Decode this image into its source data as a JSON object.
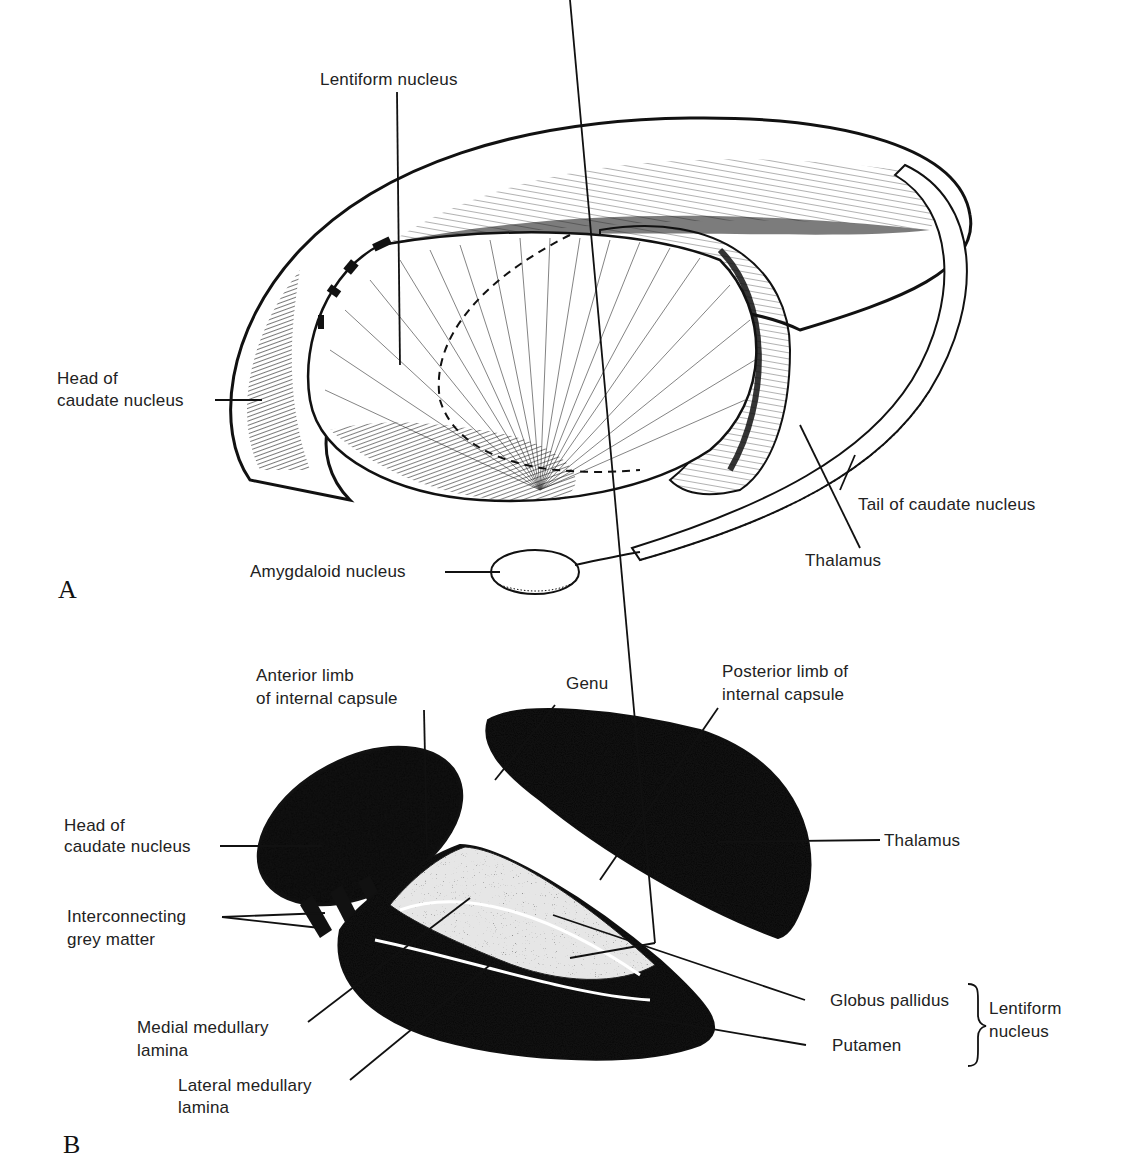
{
  "panels": [
    {
      "letter": "A",
      "labels": {
        "lentiform": "Lentiform nucleus",
        "head_caudate_1": "Head of",
        "head_caudate_2": "caudate nucleus",
        "tail_caudate": "Tail of caudate nucleus",
        "thalamus": "Thalamus",
        "amygdaloid": "Amygdaloid nucleus"
      }
    },
    {
      "letter": "B",
      "labels": {
        "anterior_limb_1": "Anterior limb",
        "anterior_limb_2": "of internal capsule",
        "genu": "Genu",
        "posterior_limb_1": "Posterior limb of",
        "posterior_limb_2": "internal capsule",
        "head_caudate_1": "Head of",
        "head_caudate_2": "caudate nucleus",
        "thalamus": "Thalamus",
        "interconnecting_1": "Interconnecting",
        "interconnecting_2": "grey matter",
        "globus_pallidus": "Globus pallidus",
        "putamen": "Putamen",
        "lentiform_1": "Lentiform",
        "lentiform_2": "nucleus",
        "medial_lamina_1": "Medial medullary",
        "medial_lamina_2": "lamina",
        "lateral_lamina_1": "Lateral medullary",
        "lateral_lamina_2": "lamina"
      }
    }
  ]
}
